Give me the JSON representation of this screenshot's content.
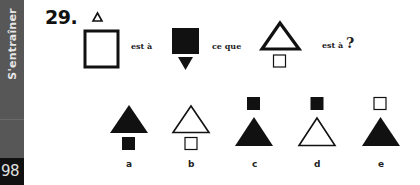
{
  "sidebar": {
    "section_label": "S'entraîner",
    "page_number": "98"
  },
  "question": {
    "number": "29.",
    "text_segments": {
      "is_to_1": "est à",
      "as": "ce que",
      "is_to_2": "est à",
      "question_mark": "?"
    },
    "analogy": {
      "figure_1": {
        "description": "small outline triangle above large outline square"
      },
      "figure_2": {
        "description": "large black square above small black downward triangle"
      },
      "figure_3": {
        "description": "large outline triangle above small outline square"
      }
    },
    "options": [
      {
        "label": "a",
        "description": "black triangle above black square"
      },
      {
        "label": "b",
        "description": "outline triangle above outline square"
      },
      {
        "label": "c",
        "description": "black square above black triangle"
      },
      {
        "label": "d",
        "description": "black square above outline triangle"
      },
      {
        "label": "e",
        "description": "outline square above black triangle"
      }
    ]
  },
  "colors": {
    "sidebar_bg": "#575757",
    "page_num_bg": "#111111",
    "ink": "#111111"
  }
}
